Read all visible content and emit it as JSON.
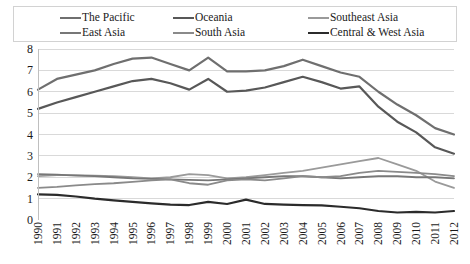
{
  "chart_data": {
    "type": "line",
    "title": "",
    "xlabel": "",
    "ylabel": "",
    "ylim": [
      0,
      8
    ],
    "yticks": [
      0,
      1,
      2,
      3,
      4,
      5,
      6,
      7,
      8
    ],
    "grid": true,
    "legend_position": "top",
    "categories": [
      "1990",
      "1991",
      "1992",
      "1993",
      "1994",
      "1995",
      "1996",
      "1997",
      "1998",
      "1999",
      "2000",
      "2001",
      "2002",
      "2003",
      "2004",
      "2005",
      "2006",
      "2007",
      "2008",
      "2009",
      "2010",
      "2011",
      "2012"
    ],
    "series": [
      {
        "name": "The Pacific",
        "color": "#6f6f6f",
        "width": 2.2,
        "values": [
          6.1,
          6.6,
          6.8,
          7.0,
          7.3,
          7.55,
          7.6,
          7.3,
          7.0,
          7.6,
          6.95,
          6.95,
          7.0,
          7.2,
          7.5,
          7.2,
          6.9,
          6.7,
          6.0,
          5.4,
          4.9,
          4.3,
          4.0
        ]
      },
      {
        "name": "Oceania",
        "color": "#585858",
        "width": 2.2,
        "values": [
          5.2,
          5.5,
          5.75,
          6.0,
          6.25,
          6.5,
          6.6,
          6.4,
          6.1,
          6.6,
          6.0,
          6.05,
          6.2,
          6.45,
          6.7,
          6.45,
          6.15,
          6.25,
          5.3,
          4.6,
          4.1,
          3.4,
          3.1
        ]
      },
      {
        "name": "Southeast Asia",
        "color": "#9a9a9a",
        "width": 1.8,
        "values": [
          2.05,
          2.1,
          2.1,
          2.08,
          2.05,
          2.0,
          1.95,
          2.0,
          2.15,
          2.1,
          1.95,
          2.0,
          2.1,
          2.2,
          2.3,
          2.45,
          2.6,
          2.75,
          2.9,
          2.6,
          2.3,
          1.8,
          1.5
        ]
      },
      {
        "name": "East Asia",
        "color": "#777777",
        "width": 1.8,
        "values": [
          2.15,
          2.12,
          2.08,
          2.05,
          2.0,
          1.95,
          1.92,
          1.9,
          1.88,
          1.85,
          1.9,
          1.95,
          2.0,
          2.05,
          2.05,
          2.0,
          1.95,
          2.0,
          2.05,
          2.05,
          2.0,
          2.0,
          1.95
        ]
      },
      {
        "name": "South Asia",
        "color": "#8a8a8a",
        "width": 1.8,
        "values": [
          1.5,
          1.55,
          1.62,
          1.68,
          1.72,
          1.78,
          1.85,
          1.9,
          1.72,
          1.65,
          1.85,
          1.9,
          1.85,
          1.95,
          2.05,
          2.0,
          2.05,
          2.2,
          2.3,
          2.25,
          2.2,
          2.15,
          2.05
        ]
      },
      {
        "name": "Central & West Asia",
        "color": "#2b2b2b",
        "width": 2.2,
        "values": [
          1.2,
          1.18,
          1.1,
          1.0,
          0.92,
          0.85,
          0.78,
          0.72,
          0.7,
          0.85,
          0.75,
          0.95,
          0.75,
          0.72,
          0.7,
          0.68,
          0.62,
          0.55,
          0.42,
          0.35,
          0.38,
          0.35,
          0.42
        ]
      }
    ]
  },
  "legend": {
    "rows": [
      [
        {
          "label": "The Pacific",
          "color": "#6f6f6f",
          "width": 2.5
        },
        {
          "label": "Oceania",
          "color": "#585858",
          "width": 2.5
        },
        {
          "label": "Southeast Asia",
          "color": "#9a9a9a",
          "width": 2
        }
      ],
      [
        {
          "label": "East Asia",
          "color": "#777777",
          "width": 2
        },
        {
          "label": "South Asia",
          "color": "#8a8a8a",
          "width": 2
        },
        {
          "label": "Central & West Asia",
          "color": "#2b2b2b",
          "width": 2.5
        }
      ]
    ]
  },
  "axes": {
    "y_tick_labels": [
      "8",
      "7",
      "6",
      "5",
      "4",
      "3",
      "2",
      "1",
      "0"
    ],
    "x_tick_labels": [
      "1990",
      "1991",
      "1992",
      "1993",
      "1994",
      "1995",
      "1996",
      "1997",
      "1998",
      "1999",
      "2000",
      "2001",
      "2002",
      "2003",
      "2004",
      "2005",
      "2006",
      "2007",
      "2008",
      "2009",
      "2010",
      "2011",
      "2012"
    ]
  },
  "style": {
    "gridline_color": "#d9d9d9",
    "axis_color": "#bfbfbf",
    "legend_border_color": "#d2d2d2",
    "background": "#ffffff",
    "text_color": "#1a1a1a"
  }
}
